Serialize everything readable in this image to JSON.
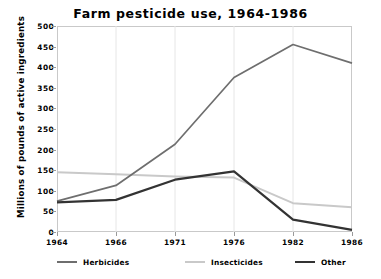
{
  "chart_data": {
    "type": "line",
    "title": "Farm pesticide use, 1964-1986",
    "xlabel": "",
    "ylabel": "Millions of pounds of active ingredients",
    "categories": [
      "1964",
      "1966",
      "1971",
      "1976",
      "1982",
      "1986"
    ],
    "ylim": [
      0,
      500
    ],
    "ytick_step": 50,
    "yticks": [
      "500",
      "450",
      "400",
      "350",
      "300",
      "250",
      "200",
      "150",
      "100",
      "50",
      "0"
    ],
    "grid": false,
    "legend_position": "bottom",
    "series": [
      {
        "name": "Herbicides",
        "color": "#6e6e6e",
        "values": [
          75,
          113,
          213,
          375,
          455,
          410
        ]
      },
      {
        "name": "Insecticides",
        "color": "#c9c9c9",
        "values": [
          145,
          140,
          135,
          132,
          70,
          60
        ]
      },
      {
        "name": "Other",
        "color": "#333333",
        "values": [
          72,
          78,
          127,
          147,
          30,
          5
        ]
      }
    ]
  }
}
